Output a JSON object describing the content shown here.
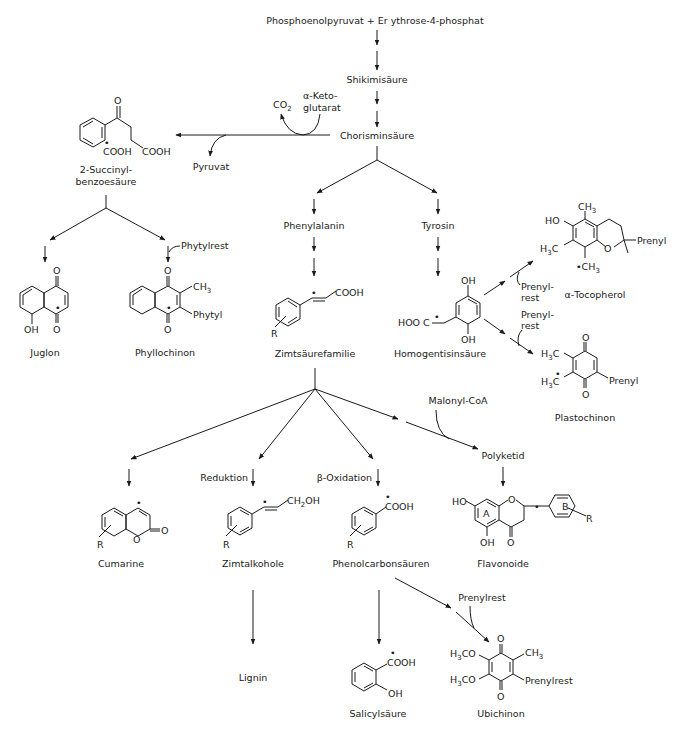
{
  "diagram": {
    "title_start": "Phosphoenolpyruvat + Er ythrose-4-phosphat",
    "nodes": {
      "shikimi": "Shikimisäure",
      "chorismin": "Chorisminsäure",
      "co2": "CO",
      "co2_sub": "2",
      "ketoglutarat_1": "α-Keto-",
      "ketoglutarat_2": "glutarat",
      "pyruvat": "Pyruvat",
      "succinyl_1": "2-Succinyl-",
      "succinyl_2": "benzoesäure",
      "phytylrest": "Phytylrest",
      "juglon": "Juglon",
      "phyllochinon": "Phyllochinon",
      "phenylalanin": "Phenylalanin",
      "tyrosin": "Tyrosin",
      "zimtsaeure": "Zimtsäurefamilie",
      "homogentisin": "Homogentisinsäure",
      "prenylrest_a_1": "Prenyl-",
      "prenylrest_a_2": "rest",
      "prenylrest_b_1": "Prenyl-",
      "prenylrest_b_2": "rest",
      "tocopherol": "α-Tocopherol",
      "plastochinon": "Plastochinon",
      "malonyl": "Malonyl-CoA",
      "polyketid": "Polyketid",
      "reduktion": "Reduktion",
      "betaoxidation": "β-Oxidation",
      "cumarine": "Cumarine",
      "zimtalkohole": "Zimtalkohole",
      "phenolcarbon": "Phenolcarbonsäuren",
      "flavonoide": "Flavonoide",
      "lignin": "Lignin",
      "salicyl": "Salicylsäure",
      "prenylrest_c": "Prenylrest",
      "ubichinon": "Ubichinon"
    },
    "atoms": {
      "O": "O",
      "COOH": "COOH",
      "OH": "OH",
      "HO": "HO",
      "CH3": "CH",
      "sub3": "3",
      "sub2": "2",
      "H3C_H": "H",
      "H3C_C": "C",
      "H3CO_H": "H",
      "H3CO_CO": "CO",
      "Phytyl": "Phytyl",
      "Prenyl": "Prenyl",
      "Prenylrest": "Prenylrest",
      "R": "R",
      "A": "A",
      "B": "B",
      "HOOC": "HOO C",
      "CH2OH": "CH",
      "CH2OH_tail": "OH",
      "dot": "•",
      "CH3dot": "•CH"
    }
  }
}
